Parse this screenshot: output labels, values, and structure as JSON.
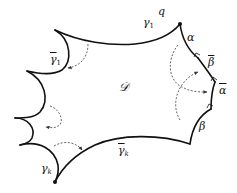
{
  "diagram": {
    "type": "hyperbolic-polygon-schematic",
    "region_label": "𝒟",
    "vertices": [
      {
        "name": "q",
        "label": "q"
      }
    ],
    "edges": [
      {
        "id": "gamma1",
        "label": "γ",
        "sub": "1",
        "barred": false
      },
      {
        "id": "gamma1bar",
        "label": "γ",
        "sub": "1",
        "barred": true
      },
      {
        "id": "gammak",
        "label": "γ",
        "sub": "k",
        "barred": false
      },
      {
        "id": "gammakbar",
        "label": "γ",
        "sub": "k",
        "barred": true
      },
      {
        "id": "alpha",
        "label": "α",
        "barred": false
      },
      {
        "id": "betabar",
        "label": "β",
        "barred": true
      },
      {
        "id": "alphabar",
        "label": "α",
        "barred": true
      },
      {
        "id": "beta",
        "label": "β",
        "barred": false
      }
    ],
    "arrows": [
      {
        "from": "gamma1",
        "to": "gamma1bar",
        "style": "dashed"
      },
      {
        "from": "left-cusp-arc",
        "to": "left-cusp-arc",
        "style": "dashed"
      },
      {
        "from": "gammak",
        "to": "gammakbar",
        "style": "dashed"
      },
      {
        "from": "alpha",
        "to": "alphabar",
        "style": "dashed"
      },
      {
        "from": "beta",
        "to": "betabar",
        "style": "dashed"
      }
    ],
    "colors": {
      "stroke": "#111111",
      "dashed": "#555555",
      "background": "#ffffff"
    }
  }
}
